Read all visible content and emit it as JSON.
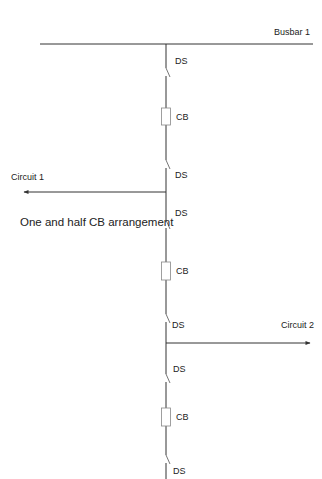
{
  "diagram": {
    "title": "One and half CB arrangement",
    "busbar": {
      "label": "Busbar 1"
    },
    "circuits": [
      {
        "label": "Circuit 1",
        "direction": "left"
      },
      {
        "label": "Circuit 2",
        "direction": "right"
      }
    ],
    "components": [
      {
        "type": "disconnect-switch",
        "label": "DS"
      },
      {
        "type": "circuit-breaker",
        "label": "CB"
      },
      {
        "type": "disconnect-switch",
        "label": "DS"
      },
      {
        "type": "disconnect-switch",
        "label": "DS"
      },
      {
        "type": "circuit-breaker",
        "label": "CB"
      },
      {
        "type": "disconnect-switch",
        "label": "DS"
      },
      {
        "type": "disconnect-switch",
        "label": "DS"
      },
      {
        "type": "circuit-breaker",
        "label": "CB"
      },
      {
        "type": "disconnect-switch",
        "label": "DS"
      }
    ]
  }
}
